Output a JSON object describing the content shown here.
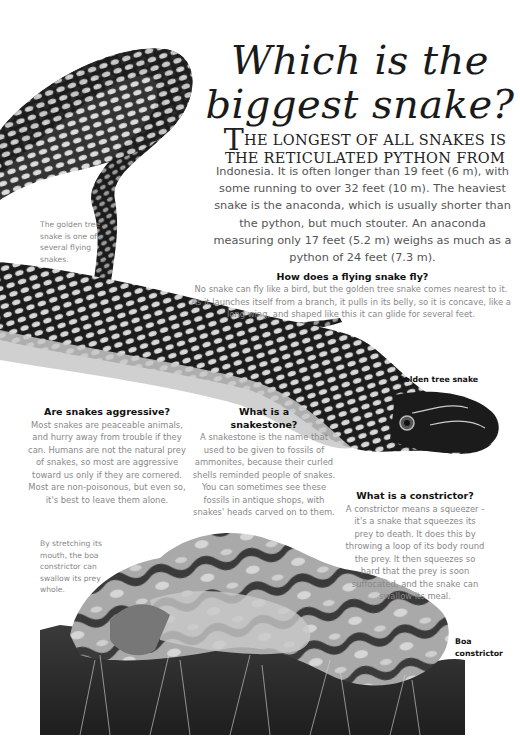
{
  "page": {
    "title_line1": "Which is the",
    "title_line2": "biggest snake?",
    "intro": {
      "dropcap": "T",
      "lead": "he longest of all snakes is the reticulated python from",
      "body": "Indonesia. It is often longer than 19 feet (6 m), with some running to over 32 feet (10 m). The heaviest snake is the anaconda, which is usually shorter than the python, but much stouter. An anaconda measuring only 17 feet (5.2 m) weighs as much as a python of 24 feet (7.3 m)."
    },
    "captions": {
      "golden_tree_snake_flying": "The golden tree snake is one of several flying snakes.",
      "boa_swallow": "By stretching its mouth, the boa constrictor can swallow its prey whole."
    },
    "labels": {
      "golden_tree_snake": "Golden tree snake",
      "boa_line1": "Boa",
      "boa_line2": "constrictor"
    },
    "sections": [
      {
        "heading": "How does a flying snake fly?",
        "body": "No snake can fly like a bird, but the golden tree snake comes nearest to it. As it launches itself from a branch, it pulls in its belly, so it is concave, like a long wing, and shaped like this it can glide for several feet."
      },
      {
        "heading": "Are snakes aggressive?",
        "body": "Most snakes are peaceable animals, and hurry away from trouble if they can. Humans are not the natural prey of snakes, so most are aggressive toward us only if they are cornered. Most are non-poisonous, but even so, it's best to leave them alone."
      },
      {
        "heading_line1": "What is a",
        "heading_line2": "snakestone?",
        "body": "A snakestone is the name that used to be given to fossils of ammonites, because their curled shells reminded people of snakes. You can sometimes see these fossils in antique shops, with snakes' heads carved on to them."
      },
      {
        "heading": "What is a constrictor?",
        "body": "A constrictor means a squeezer - it's a snake that squeezes its prey to death. It does this by throwing a loop of its body round the prey. It then squeezes so hard that the prey is soon suffocated, and the snake can swallow its meal."
      }
    ],
    "illustrations": {
      "top": "golden-tree-snake-illustration",
      "bottom": "boa-constrictor-illustration"
    }
  }
}
